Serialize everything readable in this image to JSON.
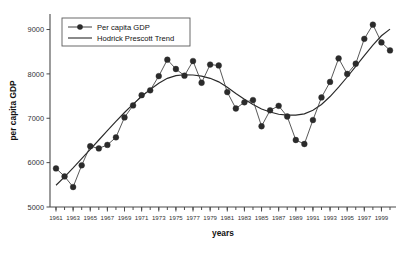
{
  "chart_data": {
    "type": "line",
    "title": "",
    "xlabel": "years",
    "ylabel": "per capita GDP",
    "xlim": [
      1960.3,
      2000.7
    ],
    "ylim": [
      5000,
      9350
    ],
    "grid": false,
    "legend_position": "top-left",
    "x": [
      1961,
      1962,
      1963,
      1964,
      1965,
      1966,
      1967,
      1968,
      1969,
      1970,
      1971,
      1972,
      1973,
      1974,
      1975,
      1976,
      1977,
      1978,
      1979,
      1980,
      1981,
      1982,
      1983,
      1984,
      1985,
      1986,
      1987,
      1988,
      1989,
      1990,
      1991,
      1992,
      1993,
      1994,
      1995,
      1996,
      1997,
      1998,
      1999,
      2000
    ],
    "xticks": [
      1961,
      1963,
      1965,
      1967,
      1969,
      1971,
      1973,
      1975,
      1977,
      1979,
      1981,
      1983,
      1985,
      1987,
      1989,
      1991,
      1993,
      1995,
      1997,
      1999
    ],
    "xticklabels": [
      "1961",
      "1963",
      "1965",
      "1967",
      "1969",
      "1971",
      "1973",
      "1975",
      "1977",
      "1979",
      "1981",
      "1983",
      "1985",
      "1987",
      "1989",
      "1991",
      "1993",
      "1995",
      "1997",
      "1999"
    ],
    "yticks": [
      5000,
      6000,
      7000,
      8000,
      9000
    ],
    "yticklabels": [
      "5000",
      "6000",
      "7000",
      "8000",
      "9000"
    ],
    "series": [
      {
        "name": "Per capita GDP",
        "style": "line-with-markers",
        "color": "#2b2b2b",
        "values": [
          5870,
          5690,
          5450,
          5940,
          6370,
          6320,
          6400,
          6570,
          7020,
          7290,
          7520,
          7630,
          7950,
          8320,
          8110,
          7960,
          8290,
          7800,
          8210,
          8190,
          7590,
          7220,
          7360,
          7410,
          6820,
          7180,
          7280,
          7040,
          6510,
          6420,
          6960,
          7470,
          7820,
          8350,
          8000,
          8230,
          8790,
          9110,
          8710,
          8530
        ]
      },
      {
        "name": "Hodrick Prescott Trend",
        "style": "line",
        "color": "#2a2a2a",
        "values": [
          5490,
          5680,
          5880,
          6090,
          6300,
          6510,
          6720,
          6930,
          7130,
          7320,
          7490,
          7650,
          7790,
          7900,
          7960,
          7980,
          7975,
          7950,
          7900,
          7820,
          7700,
          7560,
          7430,
          7310,
          7210,
          7140,
          7090,
          7070,
          7070,
          7100,
          7180,
          7310,
          7490,
          7700,
          7930,
          8170,
          8410,
          8650,
          8860,
          9010
        ]
      }
    ],
    "legend": [
      {
        "label": "Per capita GDP",
        "marker": true
      },
      {
        "label": "Hodrick Prescott Trend",
        "marker": false
      }
    ]
  }
}
